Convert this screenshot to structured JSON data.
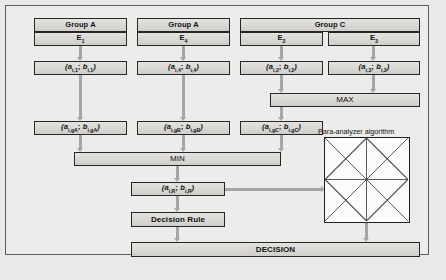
{
  "diagram": {
    "colors": {
      "page_background": "#e9e9e7",
      "frame_background": "#edecea",
      "node_fill": "#dad9d6",
      "node_border": "#262626",
      "connector": "#a6a6a4"
    },
    "groups": [
      {
        "label": "Group A"
      },
      {
        "label": "Group A"
      },
      {
        "label": "Group C"
      }
    ],
    "experts": [
      {
        "label": "E",
        "sub": "1"
      },
      {
        "label": "E",
        "sub": "4"
      },
      {
        "label": "E",
        "sub": "2"
      },
      {
        "label": "E",
        "sub": "3"
      }
    ],
    "pairs_row1": [
      {
        "a": "a",
        "a_sub": "i,1",
        "b": "b",
        "b_sub": "i,1"
      },
      {
        "a": "a",
        "a_sub": "i,4",
        "b": "b",
        "b_sub": "i,4"
      },
      {
        "a": "a",
        "a_sub": "i,2",
        "b": "b",
        "b_sub": "i,2"
      },
      {
        "a": "a",
        "a_sub": "i,3",
        "b": "b",
        "b_sub": "i,3"
      }
    ],
    "max_label": "MAX",
    "pairs_row2": [
      {
        "a": "a",
        "a_sub": "i,gA",
        "b": "b",
        "b_sub": "i,gA"
      },
      {
        "a": "a",
        "a_sub": "i,gB",
        "b": "b",
        "b_sub": "i,gB"
      },
      {
        "a": "a",
        "a_sub": "i,gC",
        "b": "b",
        "b_sub": "i,gC"
      }
    ],
    "min_label": "MIN",
    "result_pair": {
      "a": "a",
      "a_sub": "i,R",
      "b": "b",
      "b_sub": "i,R"
    },
    "decision_rule_label": "Decision Rule",
    "decision_label": "DECISION",
    "para_analyzer_label": "Para-analyzer algorithm"
  }
}
